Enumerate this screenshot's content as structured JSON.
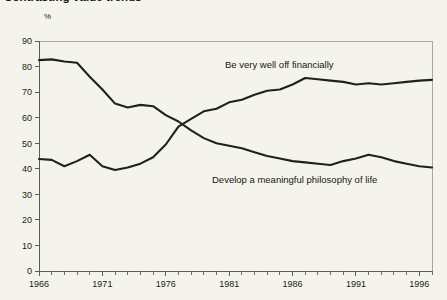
{
  "title": "Contrasting value trends",
  "unit_label": "%",
  "chart_data": {
    "type": "line",
    "title": "Contrasting value trends",
    "subtitle": "",
    "xlabel": "",
    "ylabel": "%",
    "ylim": [
      0,
      90
    ],
    "xlim": [
      1966,
      1997
    ],
    "ytick_labels": [
      "0",
      "10",
      "20",
      "30",
      "40",
      "50",
      "60",
      "70",
      "80",
      "90"
    ],
    "ytick_values": [
      0,
      10,
      20,
      30,
      40,
      50,
      60,
      70,
      80,
      90
    ],
    "xtick_labels": [
      "1966",
      "1971",
      "1976",
      "1981",
      "1986",
      "1991",
      "1996"
    ],
    "xtick_values": [
      1966,
      1971,
      1976,
      1981,
      1986,
      1991,
      1996
    ],
    "xtick_minor_step": 1,
    "grid": false,
    "legend": "inline-annotations",
    "legend_position": "in-plot",
    "x": [
      1966,
      1967,
      1968,
      1969,
      1970,
      1971,
      1972,
      1973,
      1974,
      1975,
      1976,
      1977,
      1978,
      1979,
      1980,
      1981,
      1982,
      1983,
      1984,
      1985,
      1986,
      1987,
      1988,
      1989,
      1990,
      1991,
      1992,
      1993,
      1994,
      1995,
      1996,
      1997
    ],
    "series": [
      {
        "name": "Develop a meaningful philosophy of life",
        "label": "Develop a meaningful philosophy of life",
        "color": "#20201c",
        "values": [
          82.5,
          82.8,
          82.0,
          81.5,
          76.0,
          71.0,
          65.5,
          64.0,
          65.0,
          64.5,
          61.0,
          58.5,
          55.0,
          52.0,
          50.0,
          49.0,
          48.0,
          46.5,
          45.0,
          44.0,
          43.0,
          42.5,
          42.0,
          41.5,
          43.0,
          44.0,
          45.5,
          44.5,
          43.0,
          42.0,
          41.0,
          40.5
        ]
      },
      {
        "name": "Be very well off financially",
        "label": "Be very well off financially",
        "color": "#20201c",
        "values": [
          43.8,
          43.5,
          41.0,
          43.0,
          45.5,
          41.0,
          39.5,
          40.5,
          42.0,
          44.5,
          49.5,
          56.5,
          59.5,
          62.5,
          63.5,
          66.0,
          67.0,
          69.0,
          70.5,
          71.0,
          73.0,
          75.5,
          75.0,
          74.5,
          74.0,
          73.0,
          73.5,
          73.0,
          73.5,
          74.0,
          74.5,
          74.8
        ]
      }
    ],
    "annotations": [
      {
        "text": "Be very well off financially",
        "x_px": 225,
        "y_px": 68,
        "series": "Be very well off financially"
      },
      {
        "text": "Develop a meaningful philosophy of life",
        "x_px": 212,
        "y_px": 183,
        "series": "Develop a meaningful philosophy of life"
      }
    ],
    "crossover": {
      "approx_year": 1977,
      "approx_value": 58
    }
  },
  "axes": {
    "plot_left_px": 39,
    "plot_right_px": 432,
    "plot_top_px": 41,
    "plot_bottom_px": 271
  }
}
